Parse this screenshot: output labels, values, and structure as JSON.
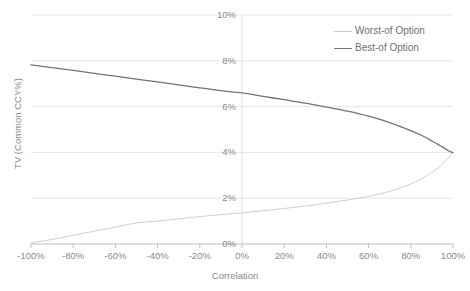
{
  "chart_data": {
    "type": "line",
    "title": "",
    "xlabel": "Correlation",
    "ylabel": "TV (Common CCY%)",
    "xlim": [
      -100,
      100
    ],
    "ylim": [
      0,
      10
    ],
    "grid": true,
    "legend_position": "top-right",
    "x_tick_labels": [
      "-100%",
      "-80%",
      "-60%",
      "-40%",
      "-20%",
      "0%",
      "20%",
      "40%",
      "60%",
      "80%",
      "100%"
    ],
    "x_ticks": [
      -100,
      -80,
      -60,
      -40,
      -20,
      0,
      20,
      40,
      60,
      80,
      100
    ],
    "y_tick_labels": [
      "0%",
      "2%",
      "4%",
      "6%",
      "8%",
      "10%"
    ],
    "y_ticks": [
      0,
      2,
      4,
      6,
      8,
      10
    ],
    "series": [
      {
        "name": "Worst-of Option",
        "color": "#c9c9c9",
        "x": [
          -100,
          -90,
          -80,
          -70,
          -60,
          -50,
          -40,
          -30,
          -20,
          -10,
          0,
          10,
          20,
          30,
          40,
          50,
          60,
          70,
          80,
          85,
          90,
          93,
          95,
          97,
          98,
          99,
          99.5,
          100
        ],
        "values": [
          0.05,
          0.2,
          0.38,
          0.56,
          0.74,
          0.92,
          1.0,
          1.1,
          1.2,
          1.28,
          1.36,
          1.45,
          1.55,
          1.66,
          1.78,
          1.92,
          2.08,
          2.3,
          2.62,
          2.85,
          3.12,
          3.32,
          3.48,
          3.68,
          3.78,
          3.9,
          3.96,
          4.0
        ]
      },
      {
        "name": "Best-of Option",
        "color": "#737373",
        "x": [
          -100,
          -90,
          -80,
          -70,
          -60,
          -50,
          -40,
          -30,
          -20,
          -10,
          0,
          10,
          20,
          30,
          40,
          50,
          60,
          70,
          80,
          85,
          90,
          93,
          95,
          97,
          98,
          99,
          99.5,
          100
        ],
        "values": [
          7.82,
          7.7,
          7.58,
          7.45,
          7.33,
          7.2,
          7.08,
          6.95,
          6.82,
          6.7,
          6.6,
          6.45,
          6.3,
          6.15,
          5.98,
          5.8,
          5.58,
          5.3,
          4.95,
          4.75,
          4.5,
          4.34,
          4.24,
          4.12,
          4.06,
          4.02,
          4.0,
          4.0
        ]
      }
    ]
  },
  "legend": {
    "items": [
      {
        "label": "Worst-of Option"
      },
      {
        "label": "Best-of Option"
      }
    ]
  }
}
